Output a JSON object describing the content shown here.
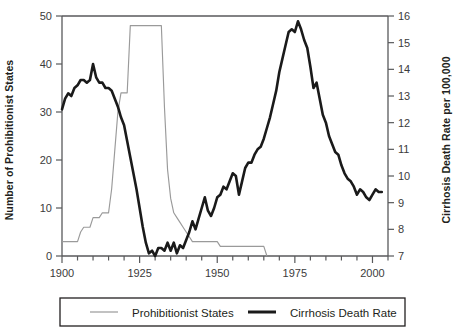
{
  "chart_data": {
    "type": "line",
    "title": "",
    "xlabel": "",
    "ylabel": "Number of Prohibitionist States",
    "ylabel_right": "Cirrhosis Death Rate per 100,000",
    "xlim": [
      1900,
      2005
    ],
    "ylim": [
      0,
      50
    ],
    "ylim_right": [
      7,
      16
    ],
    "grid": false,
    "legend_position": "bottom",
    "x_ticks": [
      1900,
      1905,
      1910,
      1915,
      1920,
      1925,
      1930,
      1935,
      1940,
      1945,
      1950,
      1955,
      1960,
      1965,
      1970,
      1975,
      1980,
      1985,
      1990,
      1995,
      2000,
      2005
    ],
    "x_tick_labels": [
      "1900",
      "",
      "",
      "",
      "",
      "1925",
      "",
      "",
      "",
      "",
      "1950",
      "",
      "",
      "",
      "",
      "1975",
      "",
      "",
      "",
      "",
      "2000",
      ""
    ],
    "y_ticks_left": [
      0,
      10,
      20,
      30,
      40,
      50
    ],
    "y_tick_labels_left": [
      "0",
      "10",
      "20",
      "30",
      "40",
      "50"
    ],
    "y_ticks_right": [
      7,
      8,
      9,
      10,
      11,
      12,
      13,
      14,
      15,
      16
    ],
    "y_tick_labels_right": [
      "7",
      "8",
      "9",
      "10",
      "11",
      "12",
      "13",
      "14",
      "15",
      "16"
    ],
    "series": [
      {
        "name": "Prohibitionist States",
        "axis": "left",
        "color": "#9a9a9a",
        "line_width": "thin",
        "x": [
          1900,
          1901,
          1902,
          1903,
          1904,
          1905,
          1906,
          1907,
          1908,
          1909,
          1910,
          1911,
          1912,
          1913,
          1914,
          1915,
          1916,
          1917,
          1918,
          1919,
          1920,
          1921,
          1922,
          1923,
          1924,
          1925,
          1926,
          1927,
          1928,
          1929,
          1930,
          1931,
          1932,
          1933,
          1934,
          1935,
          1936,
          1937,
          1938,
          1939,
          1940,
          1941,
          1942,
          1943,
          1944,
          1945,
          1946,
          1947,
          1948,
          1949,
          1950,
          1951,
          1952,
          1953,
          1954,
          1955,
          1956,
          1957,
          1958,
          1959,
          1960,
          1961,
          1962,
          1963,
          1964,
          1965,
          1966
        ],
        "y": [
          3,
          3,
          3,
          3,
          3,
          3,
          5,
          6,
          6,
          6,
          8,
          8,
          8,
          9,
          9,
          9,
          14,
          22,
          30,
          34,
          34,
          34,
          48,
          48,
          48,
          48,
          48,
          48,
          48,
          48,
          48,
          48,
          48,
          31,
          18,
          12,
          9,
          8,
          7,
          6,
          5,
          4,
          3,
          3,
          3,
          3,
          3,
          3,
          3,
          3,
          3,
          2,
          2,
          2,
          2,
          2,
          2,
          2,
          2,
          2,
          2,
          2,
          2,
          2,
          2,
          2,
          0
        ]
      },
      {
        "name": "Cirrhosis Death Rate",
        "axis": "right",
        "color": "#1a1a1a",
        "line_width": "thick",
        "x": [
          1900,
          1901,
          1902,
          1903,
          1904,
          1905,
          1906,
          1907,
          1908,
          1909,
          1910,
          1911,
          1912,
          1913,
          1914,
          1915,
          1916,
          1917,
          1918,
          1919,
          1920,
          1921,
          1922,
          1923,
          1924,
          1925,
          1926,
          1927,
          1928,
          1929,
          1930,
          1931,
          1932,
          1933,
          1934,
          1935,
          1936,
          1937,
          1938,
          1939,
          1940,
          1941,
          1942,
          1943,
          1944,
          1945,
          1946,
          1947,
          1948,
          1949,
          1950,
          1951,
          1952,
          1953,
          1954,
          1955,
          1956,
          1957,
          1958,
          1959,
          1960,
          1961,
          1962,
          1963,
          1964,
          1965,
          1966,
          1967,
          1968,
          1969,
          1970,
          1971,
          1972,
          1973,
          1974,
          1975,
          1976,
          1977,
          1978,
          1979,
          1980,
          1981,
          1982,
          1983,
          1984,
          1985,
          1986,
          1987,
          1988,
          1989,
          1990,
          1991,
          1992,
          1993,
          1994,
          1995,
          1996,
          1997,
          1998,
          1999,
          2000,
          2001,
          2002,
          2003
        ],
        "y": [
          12.5,
          12.9,
          13.1,
          13.0,
          13.3,
          13.4,
          13.6,
          13.6,
          13.5,
          13.6,
          14.2,
          13.7,
          13.5,
          13.5,
          13.3,
          13.3,
          13.2,
          12.9,
          12.6,
          12.2,
          11.9,
          11.3,
          10.7,
          10.1,
          9.5,
          8.8,
          8.1,
          7.5,
          7.1,
          7.2,
          7.0,
          7.3,
          7.3,
          7.2,
          7.5,
          7.2,
          7.5,
          7.1,
          7.4,
          7.3,
          7.6,
          7.9,
          8.3,
          8.0,
          8.4,
          8.8,
          9.2,
          8.7,
          8.5,
          8.8,
          9.2,
          9.3,
          9.6,
          9.5,
          9.8,
          10.1,
          10.0,
          9.3,
          9.8,
          10.3,
          10.5,
          10.5,
          10.8,
          11.0,
          11.1,
          11.4,
          11.8,
          12.2,
          12.7,
          13.2,
          13.9,
          14.4,
          14.9,
          15.4,
          15.5,
          15.4,
          15.8,
          15.5,
          15.1,
          14.8,
          14.1,
          13.3,
          13.5,
          12.9,
          12.3,
          12.0,
          11.5,
          11.2,
          10.9,
          10.8,
          10.4,
          10.1,
          9.9,
          9.8,
          9.6,
          9.3,
          9.5,
          9.4,
          9.2,
          9.1,
          9.3,
          9.5,
          9.4,
          9.4
        ]
      }
    ],
    "legend": [
      {
        "label": "Prohibitionist States",
        "style": "thin",
        "color": "#9a9a9a"
      },
      {
        "label": "Cirrhosis Death Rate",
        "style": "thick",
        "color": "#1a1a1a"
      }
    ]
  }
}
